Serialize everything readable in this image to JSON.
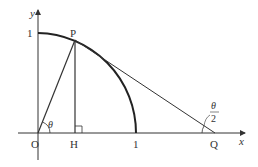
{
  "diagram": {
    "axes": {
      "x_label": "x",
      "y_label": "y"
    },
    "points": {
      "origin": "O",
      "P": "P",
      "H": "H",
      "Q": "Q",
      "x_one": "1",
      "y_one": "1"
    },
    "angles": {
      "theta": "θ",
      "half_theta_num": "θ",
      "half_theta_den": "2"
    },
    "colors": {
      "stroke": "#333333",
      "background": "#ffffff"
    }
  }
}
